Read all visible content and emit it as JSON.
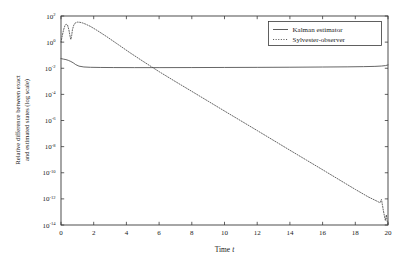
{
  "chart_data": {
    "type": "line",
    "title": "",
    "xlabel": "Time t",
    "xlabel_plain": "Time",
    "xlabel_italic": "t",
    "ylabel": "Relative difference between exact and estimated states (log scale)",
    "ylabel_line1": "Relative difference between exact",
    "ylabel_line2": "and estimated states (log scale)",
    "yscale": "log",
    "xscale": "linear",
    "xlim": [
      0,
      20
    ],
    "ylim": [
      1e-14,
      100
    ],
    "grid": false,
    "xticks": [
      0,
      2,
      4,
      6,
      8,
      10,
      12,
      14,
      16,
      18,
      20
    ],
    "xticklabels": [
      "0",
      "2",
      "4",
      "6",
      "8",
      "10",
      "12",
      "14",
      "16",
      "18",
      "20"
    ],
    "yticks": [
      100,
      1,
      0.01,
      0.0001,
      1e-06,
      1e-08,
      1e-10,
      1e-12,
      1e-14
    ],
    "ytick_exponents": [
      2,
      0,
      -2,
      -4,
      -6,
      -8,
      -10,
      -12,
      -14
    ],
    "ytick_mantissa": "10",
    "legend_position": "upper right",
    "legend_entries": [
      {
        "name": "Kalman estimator",
        "style": "solid"
      },
      {
        "name": "Sylvester-observer",
        "style": "dashed"
      }
    ],
    "series": [
      {
        "name": "Kalman estimator",
        "style": "solid",
        "x": [
          0.0,
          0.15,
          0.3,
          0.45,
          0.6,
          0.75,
          0.9,
          1.1,
          1.4,
          1.8,
          2.4,
          3.2,
          4.5,
          6.0,
          8.0,
          10.0,
          12.0,
          14.0,
          16.0,
          17.5,
          18.5,
          19.2,
          19.6,
          19.85,
          20.0
        ],
        "y": [
          0.055,
          0.05,
          0.046,
          0.04,
          0.033,
          0.026,
          0.019,
          0.0145,
          0.0125,
          0.0118,
          0.0115,
          0.0113,
          0.0112,
          0.0112,
          0.0113,
          0.0115,
          0.0117,
          0.012,
          0.0124,
          0.0128,
          0.0133,
          0.0139,
          0.0148,
          0.016,
          0.018
        ]
      },
      {
        "name": "Sylvester-observer",
        "style": "dashed",
        "x": [
          0.0,
          0.08,
          0.16,
          0.24,
          0.32,
          0.4,
          0.48,
          0.55,
          0.6,
          0.65,
          0.7,
          0.78,
          0.88,
          1.0,
          1.15,
          1.3,
          1.5,
          1.8,
          2.2,
          2.8,
          3.5,
          4.2,
          5.0,
          6.0,
          7.0,
          8.0,
          9.0,
          10.0,
          11.0,
          12.0,
          13.0,
          14.0,
          15.0,
          16.0,
          17.0,
          18.0,
          18.8,
          19.2,
          19.4,
          19.5,
          19.6,
          19.65,
          19.72,
          19.78,
          19.84,
          19.9,
          19.95,
          20.0
        ],
        "y": [
          1.0,
          3.2,
          9.0,
          18.0,
          24.0,
          20.0,
          9.0,
          3.0,
          1.6,
          3.0,
          9.0,
          20.0,
          30.0,
          34.0,
          33.0,
          30.0,
          24.0,
          16.0,
          8.0,
          2.6,
          0.65,
          0.16,
          0.035,
          0.0055,
          0.00095,
          0.00017,
          3e-05,
          5.3e-06,
          9.5e-07,
          1.7e-07,
          3e-08,
          5.3e-09,
          9.5e-10,
          1.7e-10,
          3e-11,
          5.3e-12,
          1.4e-12,
          8e-13,
          6e-13,
          5e-13,
          9e-13,
          4e-13,
          1.2e-13,
          5e-14,
          2.2e-14,
          6e-14,
          2e-14,
          1.2e-14
        ]
      }
    ]
  },
  "plot": {
    "box": {
      "left": 61,
      "top": 16,
      "right": 388,
      "bottom": 225
    }
  }
}
